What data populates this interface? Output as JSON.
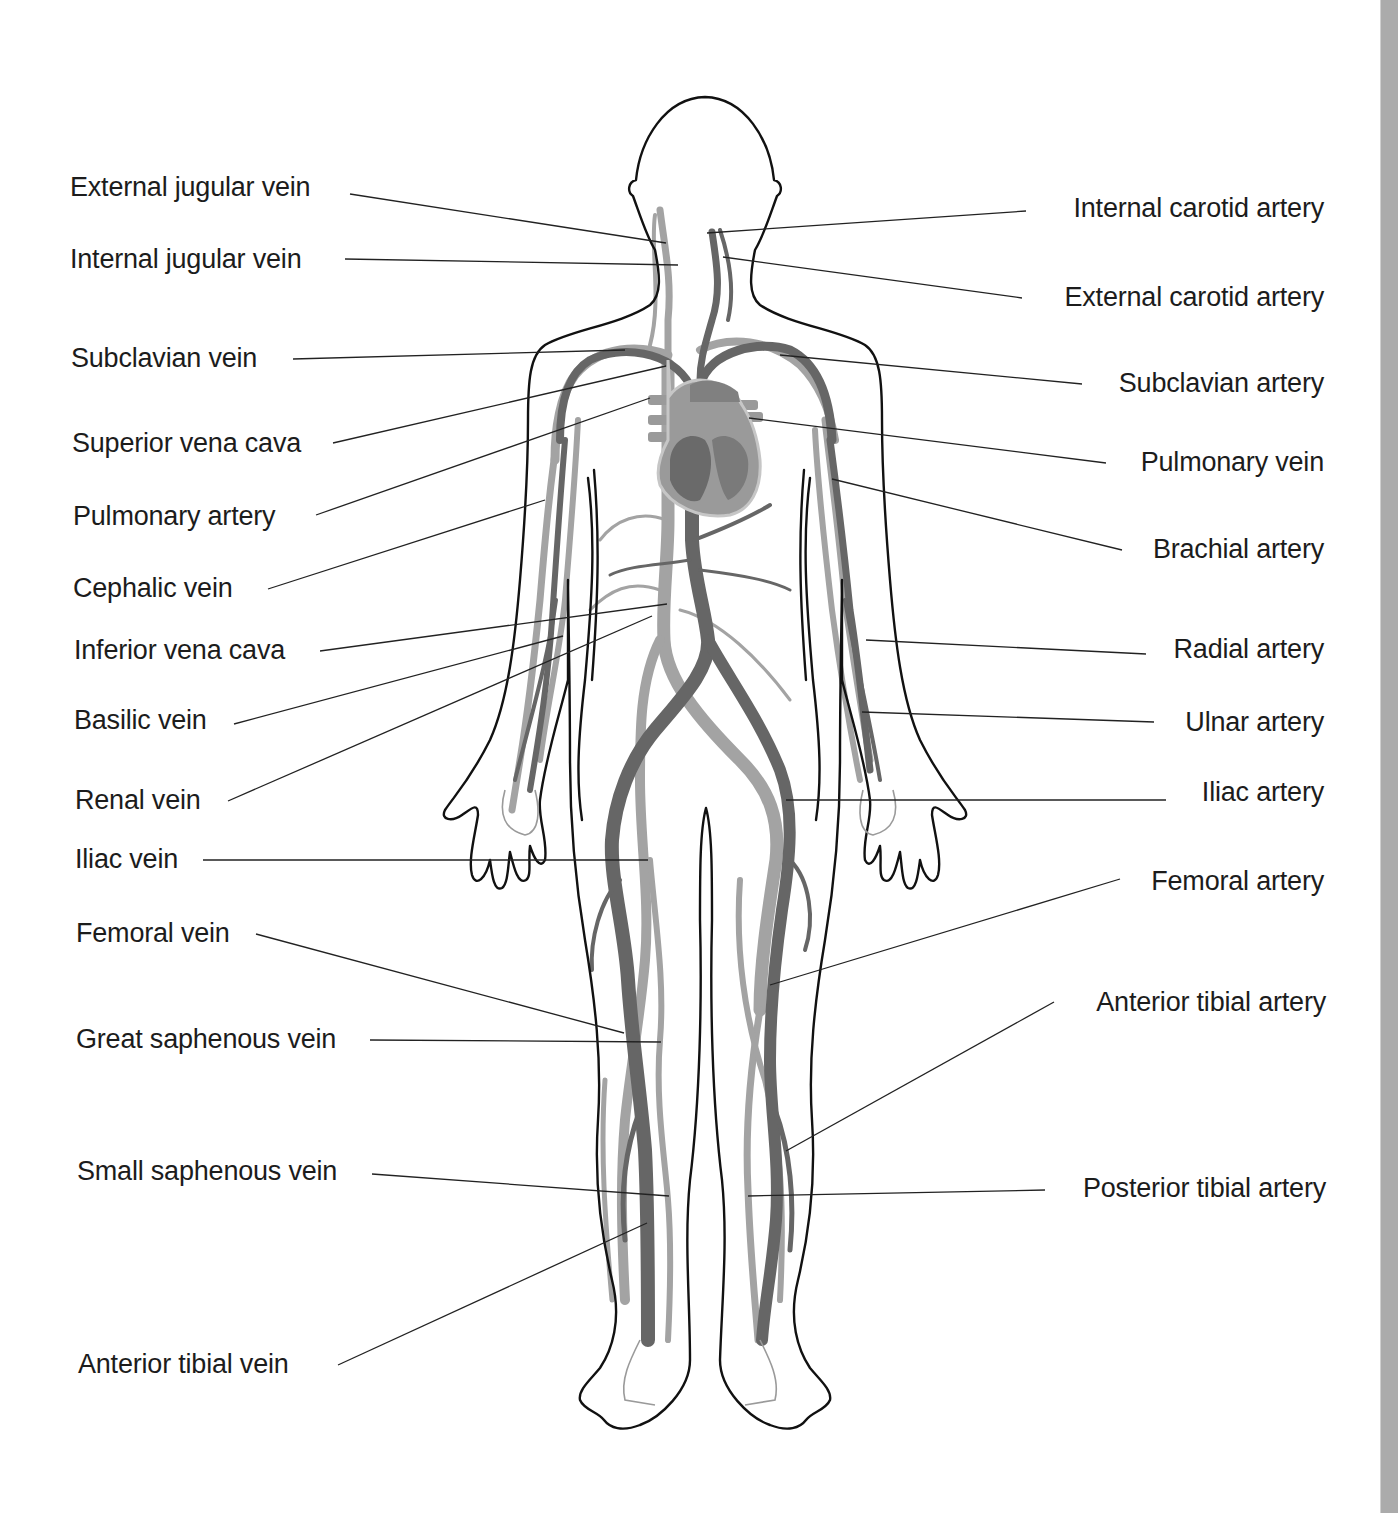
{
  "colors": {
    "background": "#ffffff",
    "outline": "#111111",
    "vein": "#9d9d9d",
    "artery": "#6b6b6b",
    "leader": "#222222",
    "scrollbar": "#ababab",
    "heart_fill": "#8a8a8a",
    "heart_light": "#b9b9b9"
  },
  "diagram": {
    "left_labels": [
      {
        "text": "External jugular vein",
        "x": 70,
        "y": 174,
        "line": [
          350,
          194,
          666,
          243
        ]
      },
      {
        "text": "Internal jugular vein",
        "x": 70,
        "y": 246,
        "line": [
          345,
          259,
          678,
          265
        ]
      },
      {
        "text": "Subclavian vein",
        "x": 71,
        "y": 345,
        "line": [
          293,
          359,
          625,
          350
        ]
      },
      {
        "text": "Superior vena cava",
        "x": 72,
        "y": 430,
        "line": [
          333,
          443,
          666,
          366
        ]
      },
      {
        "text": "Pulmonary artery",
        "x": 73,
        "y": 503,
        "line": [
          316,
          515,
          650,
          398
        ]
      },
      {
        "text": "Cephalic vein",
        "x": 73,
        "y": 575,
        "line": [
          268,
          589,
          545,
          500
        ]
      },
      {
        "text": "Inferior vena cava",
        "x": 74,
        "y": 637,
        "line": [
          320,
          651,
          667,
          604
        ]
      },
      {
        "text": "Basilic vein",
        "x": 74,
        "y": 707,
        "line": [
          234,
          724,
          563,
          636
        ]
      },
      {
        "text": "Renal vein",
        "x": 75,
        "y": 787,
        "line": [
          228,
          801,
          652,
          616
        ]
      },
      {
        "text": "Iliac vein",
        "x": 75,
        "y": 846,
        "line": [
          203,
          860,
          648,
          860
        ]
      },
      {
        "text": "Femoral vein",
        "x": 76,
        "y": 920,
        "line": [
          256,
          934,
          624,
          1033
        ]
      },
      {
        "text": "Great saphenous vein",
        "x": 76,
        "y": 1026,
        "line": [
          370,
          1040,
          661,
          1042
        ]
      },
      {
        "text": "Small saphenous vein",
        "x": 77,
        "y": 1158,
        "line": [
          372,
          1174,
          669,
          1196
        ]
      },
      {
        "text": "Anterior tibial vein",
        "x": 78,
        "y": 1351,
        "line": [
          338,
          1365,
          647,
          1223
        ]
      }
    ],
    "right_labels": [
      {
        "text": "Internal carotid artery",
        "right": 1324,
        "y": 195,
        "line": [
          1026,
          211,
          707,
          233
        ]
      },
      {
        "text": "External carotid artery",
        "right": 1324,
        "y": 284,
        "line": [
          1022,
          298,
          723,
          257
        ]
      },
      {
        "text": "Subclavian artery",
        "right": 1324,
        "y": 370,
        "line": [
          1082,
          384,
          780,
          355
        ]
      },
      {
        "text": "Pulmonary vein",
        "right": 1324,
        "y": 449,
        "line": [
          1106,
          463,
          749,
          418
        ]
      },
      {
        "text": "Brachial artery",
        "right": 1324,
        "y": 536,
        "line": [
          1122,
          550,
          832,
          479
        ]
      },
      {
        "text": "Radial artery",
        "right": 1324,
        "y": 636,
        "line": [
          1146,
          654,
          866,
          640
        ]
      },
      {
        "text": "Ulnar artery",
        "right": 1324,
        "y": 709,
        "line": [
          1154,
          722,
          862,
          712
        ]
      },
      {
        "text": "Iliac artery",
        "right": 1324,
        "y": 779,
        "line": [
          1166,
          800,
          786,
          800
        ]
      },
      {
        "text": "Femoral artery",
        "right": 1324,
        "y": 868,
        "line": [
          1120,
          879,
          770,
          985
        ]
      },
      {
        "text": "Anterior tibial artery",
        "right": 1326,
        "y": 989,
        "line": [
          1054,
          1002,
          786,
          1151
        ]
      },
      {
        "text": "Posterior tibial artery",
        "right": 1326,
        "y": 1175,
        "line": [
          1045,
          1190,
          748,
          1196
        ]
      }
    ]
  },
  "scrollbar": {
    "visible": true
  }
}
